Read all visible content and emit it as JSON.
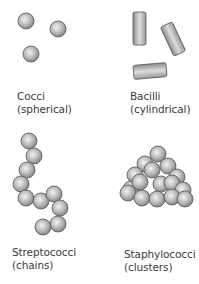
{
  "panels": [
    {
      "name": "Cocci",
      "desc": "(spherical)"
    },
    {
      "name": "Bacilli",
      "desc": "(cylindrical)"
    },
    {
      "name": "Streptococci",
      "desc": "(chains)"
    },
    {
      "name": "Staphylococci",
      "desc": "(clusters)"
    }
  ],
  "colors": {
    "cell_fill_light": "#e8e8e8",
    "cell_fill_dark": "#8a8a8a",
    "cell_outline": "#555555",
    "text": "#3a3a3a"
  }
}
